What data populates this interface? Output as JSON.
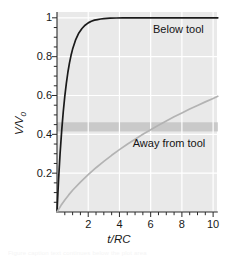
{
  "chart_data": {
    "type": "line",
    "title": "",
    "xlabel": "t/RC",
    "ylabel": "V/V0",
    "ylabel_display": "V/V",
    "ylabel_sub": "0",
    "xlim": [
      0,
      10.3
    ],
    "ylim": [
      0,
      1.03
    ],
    "grid": true,
    "grid_color": "#ffffff",
    "plot_bg": "#e9e9e9",
    "legend_position": "inline-annotations",
    "xticks": [
      2,
      4,
      6,
      8,
      10
    ],
    "xtick_labels": [
      "2",
      "4",
      "6",
      "8",
      "10"
    ],
    "xminor_step": 0.5,
    "yticks": [
      0.2,
      0.4,
      0.6,
      0.8,
      1
    ],
    "ytick_labels": [
      "0.2",
      "0.4",
      "0.6",
      "0.8",
      "1"
    ],
    "yminor_step": 0.05,
    "bands": [
      {
        "name": "threshold-band",
        "orientation": "horizontal",
        "y_start": 0.415,
        "y_end": 0.462,
        "color": "#c9c9c9"
      }
    ],
    "series": [
      {
        "name": "Below tool",
        "label": "Below tool",
        "color": "#1a1a1a",
        "width": 1.7,
        "label_x": 6.15,
        "label_y": 0.935,
        "x": [
          0,
          0.1,
          0.2,
          0.3,
          0.4,
          0.5,
          0.6,
          0.7,
          0.8,
          0.9,
          1.0,
          1.2,
          1.4,
          1.6,
          1.8,
          2.0,
          2.2,
          2.4,
          2.6,
          2.8,
          3.0,
          3.4,
          3.8,
          4.2,
          4.6,
          5.0,
          5.5,
          6.0,
          6.5,
          7.0,
          7.5,
          8.0,
          8.5,
          9.0,
          9.5,
          10.0,
          10.3
        ],
        "y": [
          0,
          0.166,
          0.304,
          0.419,
          0.515,
          0.597,
          0.664,
          0.721,
          0.768,
          0.807,
          0.839,
          0.888,
          0.922,
          0.945,
          0.962,
          0.974,
          0.982,
          0.988,
          0.991,
          0.994,
          0.996,
          0.998,
          0.999,
          0.9995,
          0.9997,
          0.9999,
          1.0,
          1.0,
          1.0,
          1.0,
          1.0,
          1.0,
          1.0,
          1.0,
          1.0,
          1.0,
          1.0
        ]
      },
      {
        "name": "Away from tool",
        "label": "Away from tool",
        "color": "#b3b3b3",
        "width": 1.7,
        "label_x": 4.85,
        "label_y": 0.352,
        "x": [
          0,
          0.25,
          0.5,
          0.75,
          1.0,
          1.5,
          2.0,
          2.5,
          3.0,
          3.5,
          4.0,
          4.5,
          5.0,
          5.5,
          6.0,
          6.5,
          7.0,
          7.5,
          8.0,
          8.5,
          9.0,
          9.5,
          10.0,
          10.3
        ],
        "y": [
          0,
          0.033,
          0.062,
          0.088,
          0.112,
          0.154,
          0.192,
          0.228,
          0.261,
          0.292,
          0.321,
          0.349,
          0.375,
          0.4,
          0.424,
          0.447,
          0.469,
          0.49,
          0.51,
          0.53,
          0.549,
          0.567,
          0.585,
          0.596
        ]
      }
    ],
    "annotations": [
      {
        "name": "below-tool-label",
        "text": "Below tool"
      },
      {
        "name": "away-from-tool-label",
        "text": "Away from tool"
      }
    ]
  },
  "caption": {
    "text": "Figure caption text continues below the plot area"
  }
}
